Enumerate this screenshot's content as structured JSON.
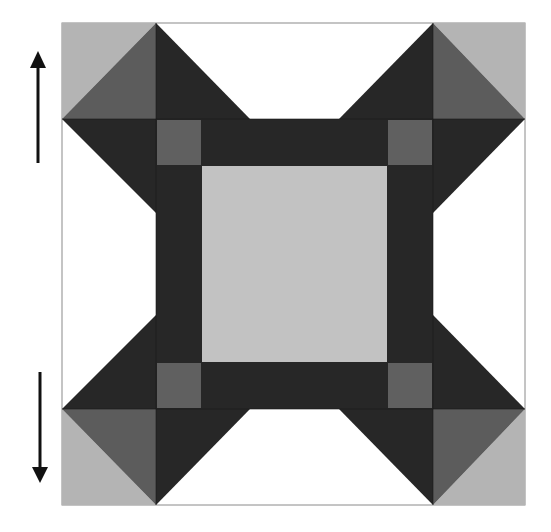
{
  "diagram": {
    "frame": {
      "x": 62,
      "y": 23,
      "width": 463,
      "height": 482,
      "stroke": "#8a8a8a"
    },
    "colors": {
      "light": "#b4b4b4",
      "center": "#c2c2c2",
      "medium": "#5c5c5c",
      "dark": "#272727",
      "small_square": "#606060"
    },
    "arrows": [
      {
        "name": "up-arrow",
        "direction": "up",
        "x": 38,
        "y1": 163,
        "y2": 51
      },
      {
        "name": "down-arrow",
        "direction": "down",
        "x": 40,
        "y1": 372,
        "y2": 483
      }
    ]
  }
}
